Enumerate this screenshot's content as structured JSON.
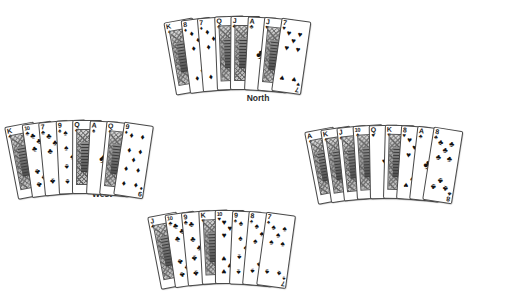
{
  "diagram": {
    "type": "bridge-hand-fan-layout"
  },
  "suit_glyphs": {
    "spade": "♠",
    "heart": "♥",
    "diamond": "♦",
    "club": "♣"
  },
  "hands": {
    "north": {
      "label": "North",
      "cards": [
        {
          "rank": "K",
          "suit": "diamond",
          "face": true
        },
        {
          "rank": "8",
          "suit": "diamond",
          "face": false
        },
        {
          "rank": "7",
          "suit": "diamond",
          "face": false
        },
        {
          "rank": "Q",
          "suit": "club",
          "face": true
        },
        {
          "rank": "J",
          "suit": "club",
          "face": true
        },
        {
          "rank": "A",
          "suit": "club",
          "face": false
        },
        {
          "rank": "J",
          "suit": "heart",
          "face": true
        },
        {
          "rank": "7",
          "suit": "heart",
          "face": false
        }
      ]
    },
    "west": {
      "label": "West",
      "cards": [
        {
          "rank": "K",
          "suit": "club",
          "face": true
        },
        {
          "rank": "10",
          "suit": "club",
          "face": false
        },
        {
          "rank": "7",
          "suit": "club",
          "face": false
        },
        {
          "rank": "9",
          "suit": "spade",
          "face": false
        },
        {
          "rank": "Q",
          "suit": "spade",
          "face": true
        },
        {
          "rank": "A",
          "suit": "spade",
          "face": false
        },
        {
          "rank": "Q",
          "suit": "diamond",
          "face": true
        },
        {
          "rank": "9",
          "suit": "diamond",
          "face": false
        }
      ]
    },
    "east": {
      "label": "East",
      "cards": [
        {
          "rank": "A",
          "suit": "diamond",
          "face": true
        },
        {
          "rank": "K",
          "suit": "spade",
          "face": true
        },
        {
          "rank": "J",
          "suit": "spade",
          "face": true
        },
        {
          "rank": "10",
          "suit": "spade",
          "face": true
        },
        {
          "rank": "Q",
          "suit": "heart",
          "face": false
        },
        {
          "rank": "K",
          "suit": "heart",
          "face": true
        },
        {
          "rank": "8",
          "suit": "heart",
          "face": false
        },
        {
          "rank": "A",
          "suit": "club",
          "face": false
        },
        {
          "rank": "8",
          "suit": "club",
          "face": false
        }
      ]
    },
    "south": {
      "label": "South",
      "cards": [
        {
          "rank": "J",
          "suit": "club",
          "face": true
        },
        {
          "rank": "10",
          "suit": "club",
          "face": false
        },
        {
          "rank": "9",
          "suit": "club",
          "face": false
        },
        {
          "rank": "K",
          "suit": "heart",
          "face": true
        },
        {
          "rank": "10",
          "suit": "heart",
          "face": false
        },
        {
          "rank": "9",
          "suit": "spade",
          "face": false
        },
        {
          "rank": "8",
          "suit": "spade",
          "face": false
        },
        {
          "rank": "7",
          "suit": "spade",
          "face": false
        }
      ]
    }
  },
  "colors": {
    "card_face": "#ffffff",
    "card_border": "#4a4a4a",
    "ink": "#111111",
    "label": "#2b2b2b",
    "background": "#ffffff"
  }
}
